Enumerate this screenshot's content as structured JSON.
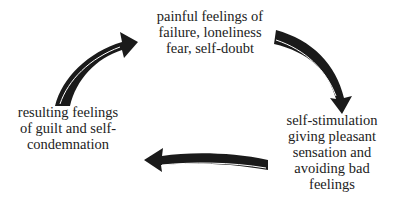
{
  "diagram": {
    "type": "cycle",
    "nodes": [
      {
        "id": "top",
        "lines": [
          "painful feelings of",
          "failure, loneliness",
          "fear, self-doubt"
        ]
      },
      {
        "id": "right",
        "lines": [
          "self-stimulation",
          "giving pleasant",
          "sensation and",
          "avoiding bad",
          "feelings"
        ]
      },
      {
        "id": "left",
        "lines": [
          "resulting feelings",
          "of guilt and self-",
          "condemnation"
        ]
      }
    ],
    "edges": [
      {
        "from": "top",
        "to": "right",
        "style": "curved-black-arrow"
      },
      {
        "from": "right",
        "to": "left",
        "style": "curved-black-arrow"
      },
      {
        "from": "left",
        "to": "top",
        "style": "curved-black-arrow"
      }
    ],
    "colors": {
      "arrow": "#1a1a1a",
      "text": "#222222",
      "highlight": "#ffffff"
    }
  }
}
